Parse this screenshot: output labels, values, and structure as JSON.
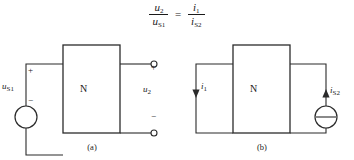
{
  "formula": {
    "lhs": {
      "numerator": "u",
      "numerator_sub": "2",
      "denominator": "u",
      "denominator_sub": "S1"
    },
    "operator": "=",
    "rhs": {
      "numerator": "i",
      "numerator_sub": "1",
      "denominator": "i",
      "denominator_sub": "S2"
    },
    "plain_text": "u2 / uS1 = i1 / iS2"
  },
  "circuit_a": {
    "caption": "(a)",
    "network_label": "N",
    "source_label": "u",
    "source_sub": "S1",
    "source_type": "voltage-source",
    "source_polarity_plus": "+",
    "source_polarity_minus": "−",
    "output_label": "u",
    "output_sub": "2",
    "output_polarity_plus": "+",
    "output_polarity_minus": "−",
    "output_terminals": "open-circuit"
  },
  "circuit_b": {
    "caption": "(b)",
    "network_label": "N",
    "source_label": "i",
    "source_sub": "S2",
    "source_type": "current-source",
    "current_label": "i",
    "current_sub": "1",
    "left_current_direction": "down",
    "source_current_direction": "up"
  },
  "style": {
    "stroke": "#2b2b2b",
    "background": "#ffffff"
  }
}
